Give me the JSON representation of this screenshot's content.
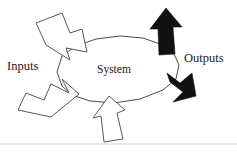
{
  "figure": {
    "width": 237,
    "height": 155,
    "background_color": "#ffffff"
  },
  "labels": {
    "inputs": "Inputs",
    "outputs": "Outputs",
    "system": "System"
  },
  "colors": {
    "outline_arrow_fill": "#ffffff",
    "outline_arrow_stroke": "#585858",
    "solid_arrow_fill": "#111111",
    "blob_stroke": "#4a4a4a",
    "text": "#1a1a1a",
    "rule": "#cfcfcf"
  },
  "shapes": {
    "system_blob": {
      "name": "system-blob",
      "points": "57,72 62,56 76,46 96,39 120,36 143,38 160,44 174,54 179,65 176,79 163,90 140,99 114,103 90,101 72,95 62,86"
    },
    "arrows": [
      {
        "name": "input-arrow-top-left",
        "style": "outline",
        "direction": "down-right",
        "points": "36,23 62,13 70,33 82,29 87,52 66,48 70,60 46,45"
      },
      {
        "name": "input-arrow-bottom-left",
        "style": "outline",
        "direction": "up-right",
        "points": "18,110 26,93 44,100 51,84 69,93 62,79 79,94 51,117"
      },
      {
        "name": "input-arrow-bottom-center",
        "style": "outline",
        "direction": "up",
        "points": "109,96 125,110 117,113 123,139 104,142 101,116 93,118"
      },
      {
        "name": "output-arrow-top-right",
        "style": "solid",
        "direction": "up",
        "points": "166,8 182,27 173,27 175,54 159,55 158,29 150,29"
      },
      {
        "name": "output-arrow-bottom-right",
        "style": "solid",
        "direction": "down-right",
        "points": "167,73 180,83 192,73 196,96 173,102 183,92 170,82"
      }
    ],
    "bottom_rule": {
      "name": "bottom-rule",
      "y": 144
    }
  }
}
